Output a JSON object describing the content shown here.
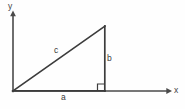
{
  "diagram": {
    "kind": "right-triangle-on-axes",
    "background_color": "#fefefe",
    "line_color": "#3c3c3c",
    "axis_color": "#4a4a4a",
    "label_color": "#3a3a3a",
    "axes": {
      "y_axis": {
        "label": "y",
        "from": {
          "x": 13,
          "y": 91
        },
        "to": {
          "x": 13,
          "y": 13
        },
        "arrow": "up"
      },
      "x_axis": {
        "label": "x",
        "from": {
          "x": 13,
          "y": 91
        },
        "to": {
          "x": 171,
          "y": 91
        },
        "arrow": "right"
      }
    },
    "triangle": {
      "vertices": {
        "origin": {
          "x": 13,
          "y": 91
        },
        "right_angle": {
          "x": 105,
          "y": 91
        },
        "apex": {
          "x": 105,
          "y": 26
        }
      },
      "sides": [
        {
          "name": "a",
          "label": "a",
          "role": "adjacent-leg",
          "orientation": "horizontal"
        },
        {
          "name": "b",
          "label": "b",
          "role": "opposite-leg",
          "orientation": "vertical"
        },
        {
          "name": "c",
          "label": "c",
          "role": "hypotenuse",
          "orientation": "diagonal"
        }
      ],
      "right_angle_marker": {
        "present": true,
        "size": 7,
        "corner": {
          "x": 105,
          "y": 91
        }
      }
    },
    "labels": {
      "y": "y",
      "x": "x",
      "a": "a",
      "b": "b",
      "c": "c"
    }
  }
}
